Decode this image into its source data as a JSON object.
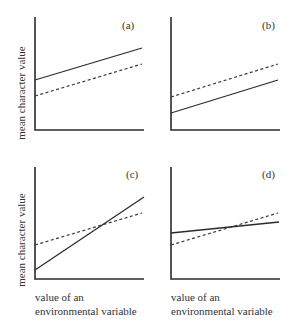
{
  "figure": {
    "y_axis_label": "mean character value",
    "x_axis_label_line1": "value of an",
    "x_axis_label_line2": "environmental variable"
  },
  "panels": [
    {
      "label": "(a)",
      "description": "parallel lines, solid above dashed"
    },
    {
      "label": "(b)",
      "description": "parallel lines, dashed above solid"
    },
    {
      "label": "(c)",
      "description": "crossing lines, solid steeper"
    },
    {
      "label": "(d)",
      "description": "crossing lines, dashed steeper"
    }
  ],
  "legend": {
    "solid": "genotype 1 (solid line)",
    "dashed": "genotype 2 (dashed line)"
  },
  "colors": {
    "line": "#2b2b2b",
    "text": "#333333",
    "background": "#ffffff"
  }
}
